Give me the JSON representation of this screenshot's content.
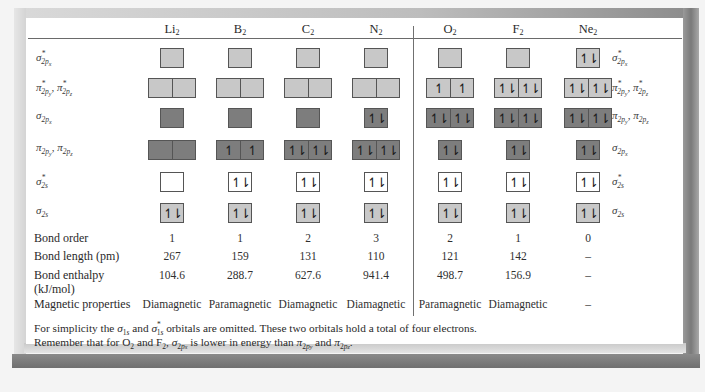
{
  "table": {
    "columns": [
      {
        "id": "li2",
        "base": "Li",
        "sub": "2",
        "x": 172
      },
      {
        "id": "b2",
        "base": "B",
        "sub": "2",
        "x": 240
      },
      {
        "id": "c2",
        "base": "C",
        "sub": "2",
        "x": 308
      },
      {
        "id": "n2",
        "base": "N",
        "sub": "2",
        "x": 376
      },
      {
        "id": "o2",
        "base": "O",
        "sub": "2",
        "x": 450
      },
      {
        "id": "f2",
        "base": "F",
        "sub": "2",
        "x": 518
      },
      {
        "id": "ne2",
        "base": "Ne",
        "sub": "2",
        "x": 588
      }
    ],
    "orbitals": [
      {
        "id": "sigma_star_2px",
        "label_left": "σ*2px",
        "label_right": "σ*2px",
        "type": "single",
        "color": "light",
        "y": 48,
        "fill": [
          [
            ""
          ],
          [
            ""
          ],
          [
            ""
          ],
          [
            ""
          ],
          [
            ""
          ],
          [
            ""
          ],
          [
            "↿⇂"
          ]
        ]
      },
      {
        "id": "pi_star_2py_2pz",
        "label_left": "π*2py, π*2pz",
        "label_right": "π*2py, π*2pz",
        "type": "double",
        "color": "light",
        "y": 78,
        "fill": [
          [
            "",
            ""
          ],
          [
            "",
            ""
          ],
          [
            "",
            ""
          ],
          [
            "",
            ""
          ],
          [
            "↿",
            "↿"
          ],
          [
            "↿⇂",
            "↿⇂"
          ],
          [
            "↿⇂",
            "↿⇂"
          ]
        ]
      },
      {
        "id": "row3",
        "label_left": "σ2px",
        "label_right": "π2py, π2pz",
        "type": "mixed",
        "y": 108,
        "fill": [
          [
            "single",
            "dark",
            [
              ""
            ]
          ],
          [
            "single",
            "dark",
            [
              ""
            ]
          ],
          [
            "single",
            "dark",
            [
              ""
            ]
          ],
          [
            "single",
            "dark",
            [
              "↿⇂"
            ]
          ],
          [
            "double",
            "dark",
            [
              "↿⇂",
              "↿⇂"
            ]
          ],
          [
            "double",
            "dark",
            [
              "↿⇂",
              "↿⇂"
            ]
          ],
          [
            "double",
            "dark",
            [
              "↿⇂",
              "↿⇂"
            ]
          ]
        ]
      },
      {
        "id": "row4",
        "label_left": "π2py, π2pz",
        "label_right": "σ2px",
        "type": "mixed",
        "y": 140,
        "fill": [
          [
            "double",
            "dark",
            [
              "",
              ""
            ]
          ],
          [
            "double",
            "dark",
            [
              "↿",
              "↿"
            ]
          ],
          [
            "double",
            "dark",
            [
              "↿⇂",
              "↿⇂"
            ]
          ],
          [
            "double",
            "dark",
            [
              "↿⇂",
              "↿⇂"
            ]
          ],
          [
            "single",
            "dark",
            [
              "↿⇂"
            ]
          ],
          [
            "single",
            "dark",
            [
              "↿⇂"
            ]
          ],
          [
            "single",
            "dark",
            [
              "↿⇂"
            ]
          ]
        ]
      },
      {
        "id": "sigma_star_2s",
        "label_left": "σ*2s",
        "label_right": "σ*2s",
        "type": "single",
        "color": "white",
        "y": 172,
        "fill": [
          [
            ""
          ],
          [
            "↿⇂"
          ],
          [
            "↿⇂"
          ],
          [
            "↿⇂"
          ],
          [
            "↿⇂"
          ],
          [
            "↿⇂"
          ],
          [
            "↿⇂"
          ]
        ]
      },
      {
        "id": "sigma_2s",
        "label_left": "σ2s",
        "label_right": "σ2s",
        "type": "single",
        "color": "light",
        "y": 203,
        "fill": [
          [
            "↿⇂"
          ],
          [
            "↿⇂"
          ],
          [
            "↿⇂"
          ],
          [
            "↿⇂"
          ],
          [
            "↿⇂"
          ],
          [
            "↿⇂"
          ],
          [
            "↿⇂"
          ]
        ]
      }
    ],
    "properties": [
      {
        "label": "Bond order",
        "y": 231,
        "values": [
          "1",
          "1",
          "2",
          "3",
          "2",
          "1",
          "0"
        ]
      },
      {
        "label": "Bond length (pm)",
        "y": 249,
        "values": [
          "267",
          "159",
          "131",
          "110",
          "121",
          "142",
          "–"
        ]
      },
      {
        "label": "Bond enthalpy",
        "label2": "(kJ/mol)",
        "y": 268,
        "values": [
          "104.6",
          "288.7",
          "627.6",
          "941.4",
          "498.7",
          "156.9",
          "–"
        ]
      },
      {
        "label": "Magnetic properties",
        "y": 297,
        "values": [
          "Diamagnetic",
          "Paramagnetic",
          "Diamagnetic",
          "Diamagnetic",
          "Paramagnetic",
          "Diamagnetic",
          "–"
        ]
      }
    ]
  },
  "footnote": {
    "line1_a": "For simplicity the ",
    "line1_b": " and ",
    "line1_c": " orbitals are omitted.  These two orbitals hold a total of four electrons.",
    "line2_a": "Remember that for O",
    "line2_b": " and F",
    "line2_c": ", ",
    "line2_d": " is lower in energy than ",
    "line2_e": " and ",
    "line2_f": "."
  },
  "colors": {
    "bonding_light": "#c8c8c8",
    "bonding_dark": "#7d7d7d",
    "antibonding_white": "#ffffff",
    "frame_gray": "#8a8a8a"
  }
}
